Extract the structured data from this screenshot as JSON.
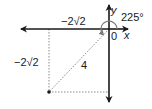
{
  "diagram": {
    "axes": {
      "x_label": "x",
      "y_label": "y",
      "origin_label": "0"
    },
    "angle_label": "225°",
    "radius_label": "4",
    "x_component_label": "−2√2",
    "y_component_label": "−2√2",
    "point": {
      "r": 4,
      "theta_deg": 225,
      "x": "−2√2",
      "y": "−2√2"
    },
    "colors": {
      "axis": "#1a1a1a",
      "dotted": "#8a8a8a",
      "arc": "#7a7a7a"
    }
  }
}
